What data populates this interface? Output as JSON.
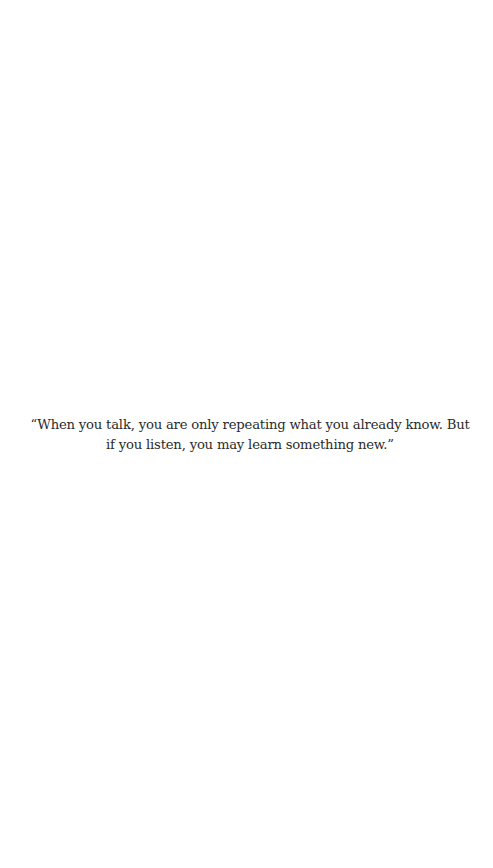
{
  "quote": {
    "text": "“When you talk, you are only repeating what you already know. But if you listen, you may learn something new.”"
  },
  "colors": {
    "background": "#ffffff",
    "text": "#2b2b2b"
  }
}
